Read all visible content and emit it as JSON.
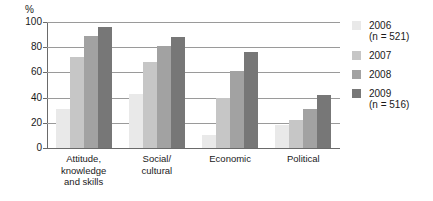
{
  "chart_data": {
    "type": "bar",
    "title": "",
    "xlabel": "",
    "ylabel": "%",
    "ylim": [
      0,
      100
    ],
    "yticks": [
      0,
      20,
      40,
      60,
      80,
      100
    ],
    "grid": true,
    "legend_position": "right",
    "categories": [
      "Attitude,\nknowledge\nand skills",
      "Social/\ncultural",
      "Economic",
      "Political"
    ],
    "category_labels": [
      [
        "Attitude,",
        "knowledge",
        "and skills"
      ],
      [
        "Social/",
        "cultural"
      ],
      [
        "Economic"
      ],
      [
        "Political"
      ]
    ],
    "series": [
      {
        "name": "2006",
        "sublabel": "(n = 521)",
        "color": "#e9e9e9",
        "values": [
          31,
          43,
          10,
          18
        ]
      },
      {
        "name": "2007",
        "sublabel": "",
        "color": "#c6c6c6",
        "values": [
          72,
          68,
          40,
          22
        ]
      },
      {
        "name": "2008",
        "sublabel": "",
        "color": "#a2a2a2",
        "values": [
          89,
          81,
          61,
          31
        ]
      },
      {
        "name": "2009",
        "sublabel": "(n = 516)",
        "color": "#777777",
        "values": [
          96,
          88,
          76,
          42
        ]
      }
    ]
  },
  "axis": {
    "unit_label": "%",
    "tick_labels": [
      "100",
      "80",
      "60",
      "40",
      "20",
      "0"
    ]
  },
  "legend": {
    "entries": [
      {
        "label": "2006",
        "sublabel": "(n = 521)"
      },
      {
        "label": "2007",
        "sublabel": ""
      },
      {
        "label": "2008",
        "sublabel": ""
      },
      {
        "label": "2009",
        "sublabel": "(n = 516)"
      }
    ]
  }
}
